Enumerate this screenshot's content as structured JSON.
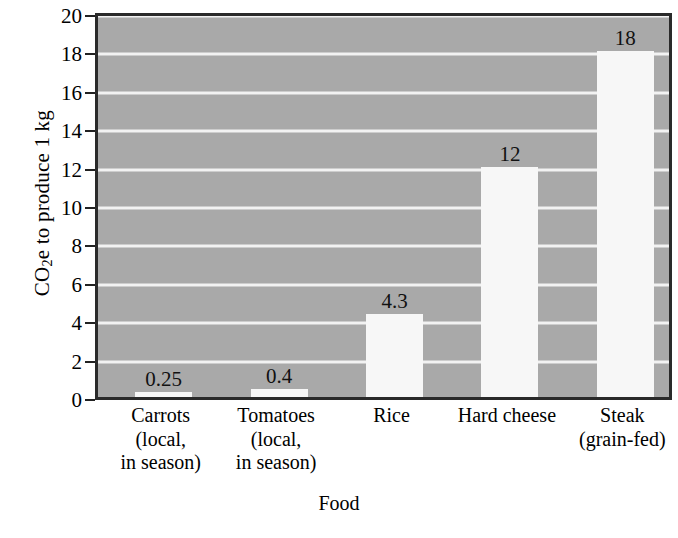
{
  "chart_data": {
    "type": "bar",
    "title": "",
    "xlabel": "Food",
    "ylabel": "CO2e to produce 1 kg",
    "ylabel_parts": {
      "prefix": "CO",
      "sub": "2",
      "suffix": "e to produce 1 kg"
    },
    "categories": [
      "Carrots (local, in season)",
      "Tomatoes (local, in season)",
      "Rice",
      "Hard cheese",
      "Steak (grain-fed)"
    ],
    "category_lines": [
      [
        "Carrots",
        "(local,",
        "in season)"
      ],
      [
        "Tomatoes",
        "(local,",
        "in season)"
      ],
      [
        "Rice"
      ],
      [
        "Hard cheese"
      ],
      [
        "Steak",
        "(grain-fed)"
      ]
    ],
    "values": [
      0.25,
      0.4,
      4.3,
      12,
      18
    ],
    "value_labels": [
      "0.25",
      "0.4",
      "4.3",
      "12",
      "18"
    ],
    "ylim": [
      0,
      20
    ],
    "ytick_values": [
      0,
      2,
      4,
      6,
      8,
      10,
      12,
      14,
      16,
      18,
      20
    ],
    "ytick_labels": [
      "0",
      "2",
      "4",
      "6",
      "8",
      "10",
      "12",
      "14",
      "16",
      "18",
      "20"
    ],
    "grid": true,
    "grid_axis": "y",
    "legend": "none",
    "colors": {
      "plot_background": "#a9a9a9",
      "bar_fill": "#f7f7f7",
      "gridline": "#f2f2f2",
      "frame": "#2a2a2a",
      "text": "#000000",
      "page_background": "#ffffff"
    }
  }
}
